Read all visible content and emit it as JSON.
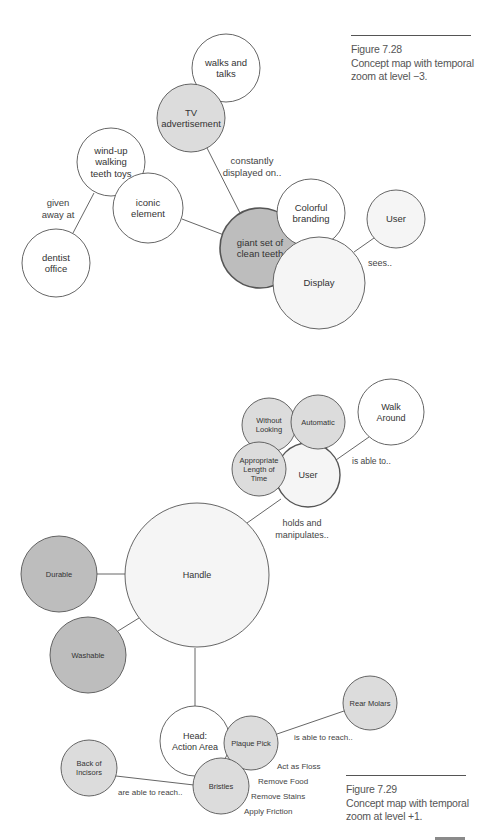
{
  "colors": {
    "white": "#ffffff",
    "light": "#f5f5f5",
    "mid": "#dcdcdc",
    "dark": "#bdbdbd",
    "stroke": "#555555"
  },
  "figure_top": {
    "caption": {
      "number": "Figure 7.28",
      "line1": "Concept map with temporal",
      "line2": "zoom at level −3."
    },
    "nodes": [
      {
        "id": "walks-and-talks",
        "lines": [
          "walks and",
          "talks"
        ],
        "fill": "white"
      },
      {
        "id": "tv-advertisement",
        "lines": [
          "TV",
          "advertisement"
        ],
        "fill": "mid"
      },
      {
        "id": "wind-up-walking-teeth-toys",
        "lines": [
          "wind-up",
          "walking",
          "teeth toys"
        ],
        "fill": "white"
      },
      {
        "id": "iconic-element",
        "lines": [
          "iconic",
          "element"
        ],
        "fill": "white"
      },
      {
        "id": "dentist-office",
        "lines": [
          "dentist",
          "office"
        ],
        "fill": "white"
      },
      {
        "id": "giant-set-of-clean-teeth",
        "lines": [
          "giant set of",
          "clean teeth"
        ],
        "fill": "dark"
      },
      {
        "id": "colorful-branding",
        "lines": [
          "Colorful",
          "branding"
        ],
        "fill": "white"
      },
      {
        "id": "display",
        "lines": [
          "Display"
        ],
        "fill": "light"
      },
      {
        "id": "user-top",
        "lines": [
          "User"
        ],
        "fill": "light"
      }
    ],
    "link_labels": [
      {
        "id": "given-away-at",
        "lines": [
          "given",
          "away at"
        ]
      },
      {
        "id": "constantly-displayed-on",
        "lines": [
          "constantly",
          "displayed on.."
        ]
      },
      {
        "id": "sees",
        "lines": [
          "sees.."
        ]
      }
    ]
  },
  "figure_bottom": {
    "caption": {
      "number": "Figure 7.29",
      "line1": "Concept map with temporal",
      "line2": "zoom at level +1."
    },
    "nodes": [
      {
        "id": "walk-around",
        "lines": [
          "Walk",
          "Around"
        ],
        "fill": "white"
      },
      {
        "id": "user-bottom",
        "lines": [
          "User"
        ],
        "fill": "light"
      },
      {
        "id": "without-looking",
        "lines": [
          "Without",
          "Looking"
        ],
        "fill": "mid"
      },
      {
        "id": "automatic",
        "lines": [
          "Automatic"
        ],
        "fill": "mid"
      },
      {
        "id": "appropriate-length-of-time",
        "lines": [
          "Appropriate",
          "Length of",
          "Time"
        ],
        "fill": "mid"
      },
      {
        "id": "handle",
        "lines": [
          "Handle"
        ],
        "fill": "light"
      },
      {
        "id": "durable",
        "lines": [
          "Durable"
        ],
        "fill": "dark"
      },
      {
        "id": "washable",
        "lines": [
          "Washable"
        ],
        "fill": "dark"
      },
      {
        "id": "head-action-area",
        "lines": [
          "Head:",
          "Action Area"
        ],
        "fill": "white"
      },
      {
        "id": "plaque-pick",
        "lines": [
          "Plaque Pick"
        ],
        "fill": "mid"
      },
      {
        "id": "bristles",
        "lines": [
          "Bristles"
        ],
        "fill": "mid"
      },
      {
        "id": "back-of-incisors",
        "lines": [
          "Back of",
          "Incisors"
        ],
        "fill": "mid"
      },
      {
        "id": "rear-molars",
        "lines": [
          "Rear Molars"
        ],
        "fill": "mid"
      }
    ],
    "link_labels": [
      {
        "id": "is-able-to",
        "lines": [
          "is able to.."
        ]
      },
      {
        "id": "holds-and-manipulates",
        "lines": [
          "holds and",
          "manipulates.."
        ]
      },
      {
        "id": "is-able-to-reach",
        "lines": [
          "is able to reach.."
        ]
      },
      {
        "id": "are-able-to-reach",
        "lines": [
          "are able to reach.."
        ]
      },
      {
        "id": "act-as-floss",
        "lines": [
          "Act as Floss"
        ]
      },
      {
        "id": "remove-food",
        "lines": [
          "Remove Food"
        ]
      },
      {
        "id": "remove-stains",
        "lines": [
          "Remove Stains"
        ]
      },
      {
        "id": "apply-friction",
        "lines": [
          "Apply Friction"
        ]
      }
    ]
  }
}
